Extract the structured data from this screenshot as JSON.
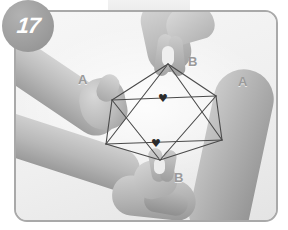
{
  "step": {
    "number": "17",
    "badge_color": "#9d9d9d",
    "badge_text_color": "#ffffff"
  },
  "frame": {
    "border_color": "#a9a9a9",
    "background_color": "#f2f2f2",
    "corner_radius_px": 13
  },
  "labels": [
    {
      "id": "a-left",
      "text": "A",
      "color": "#9a9a9a"
    },
    {
      "id": "a-right",
      "text": "A",
      "color": "#9a9a9a"
    },
    {
      "id": "b-top",
      "text": "B",
      "color": "#9a9a9a"
    },
    {
      "id": "b-bottom",
      "text": "B",
      "color": "#9a9a9a"
    }
  ],
  "markers": [
    {
      "id": "heart-upper",
      "symbol": "♥",
      "color": "#2b2b2b"
    },
    {
      "id": "heart-lower",
      "symbol": "♥",
      "color": "#2b2b2b"
    }
  ],
  "string_figure": {
    "line_color": "#4a4a4a",
    "anchors": {
      "top_pinch": {
        "x": 152,
        "y": 52
      },
      "bottom_pinch": {
        "x": 144,
        "y": 148
      },
      "left_hand": {
        "x": 96,
        "y": 88
      },
      "right_hand": {
        "x": 200,
        "y": 84
      }
    }
  },
  "hands": [
    {
      "id": "top-hand",
      "role": "pinches string at point B (upper)"
    },
    {
      "id": "bottom-hands",
      "role": "pinches string at point B (lower)"
    },
    {
      "id": "left-hand",
      "role": "holds loop at point A (left)"
    },
    {
      "id": "right-hand",
      "role": "holds loop at point A (right)"
    },
    {
      "id": "left-forearm-upper",
      "role": "crossed forearm"
    },
    {
      "id": "left-forearm-lower",
      "role": "crossed forearm"
    },
    {
      "id": "right-forearm",
      "role": "extended forearm"
    }
  ]
}
